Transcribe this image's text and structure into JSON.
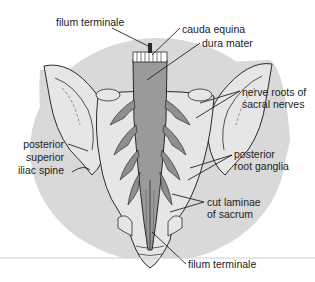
{
  "figure": {
    "colors": {
      "background_disc": "#d9d9d9",
      "bone_fill": "#e6e6e6",
      "dura_fill": "#9a9a9a",
      "outline": "#2a2a2a",
      "label_text": "#222222",
      "rule": "#cfcfcf"
    },
    "labels": [
      {
        "id": "filum-terminale-top",
        "text": "filum terminale"
      },
      {
        "id": "cauda-equina",
        "text": "cauda equina"
      },
      {
        "id": "dura-mater",
        "text": "dura mater"
      },
      {
        "id": "nerve-roots-line1",
        "text": "nerve roots of"
      },
      {
        "id": "nerve-roots-line2",
        "text": "sacral nerves"
      },
      {
        "id": "psis-line1",
        "text": "posterior"
      },
      {
        "id": "psis-line2",
        "text": "superior"
      },
      {
        "id": "psis-line3",
        "text": "iliac spine"
      },
      {
        "id": "ganglia-line1",
        "text": "posterior"
      },
      {
        "id": "ganglia-line2",
        "text": "root ganglia"
      },
      {
        "id": "laminae-line1",
        "text": "cut laminae"
      },
      {
        "id": "laminae-line2",
        "text": "of sacrum"
      },
      {
        "id": "filum-terminale-bottom",
        "text": "filum terminale"
      }
    ]
  }
}
